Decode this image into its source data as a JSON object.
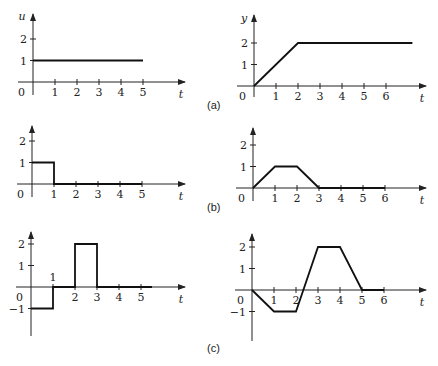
{
  "figure": {
    "panel_labels": [
      "(a)",
      "(b)",
      "(c)"
    ]
  },
  "chart_data": [
    {
      "id": "a-input",
      "panel": "(a)",
      "type": "line",
      "title": "",
      "xlabel": "t",
      "ylabel": "u",
      "x_ticks": [
        "1",
        "2",
        "3",
        "4",
        "5"
      ],
      "y_ticks": [
        "1",
        "2"
      ],
      "origin_label": "0",
      "xlim": [
        0,
        6.5
      ],
      "ylim": [
        0,
        2.5
      ],
      "grid": false,
      "points": [
        [
          0,
          1
        ],
        [
          5,
          1
        ]
      ]
    },
    {
      "id": "a-output",
      "panel": "(a)",
      "type": "line",
      "title": "",
      "xlabel": "t",
      "ylabel": "y",
      "x_ticks": [
        "1",
        "2",
        "3",
        "4",
        "5",
        "6"
      ],
      "y_ticks": [
        "1",
        "2"
      ],
      "origin_label": "0",
      "xlim": [
        0,
        7.8
      ],
      "ylim": [
        0,
        2.5
      ],
      "grid": false,
      "points": [
        [
          0,
          0
        ],
        [
          2,
          2
        ],
        [
          7.2,
          2
        ]
      ]
    },
    {
      "id": "b-input",
      "panel": "(b)",
      "type": "line",
      "title": "",
      "xlabel": "t",
      "ylabel": "",
      "x_ticks": [
        "1",
        "2",
        "3",
        "4",
        "5"
      ],
      "y_ticks": [
        "1",
        "2"
      ],
      "origin_label": "0",
      "xlim": [
        0,
        6.5
      ],
      "ylim": [
        0,
        2.5
      ],
      "grid": false,
      "points": [
        [
          0,
          1
        ],
        [
          1,
          1
        ],
        [
          1,
          0
        ],
        [
          5,
          0
        ]
      ]
    },
    {
      "id": "b-output",
      "panel": "(b)",
      "type": "line",
      "title": "",
      "xlabel": "t",
      "ylabel": "",
      "x_ticks": [
        "1",
        "2",
        "3",
        "4",
        "5",
        "6"
      ],
      "y_ticks": [
        "1",
        "2"
      ],
      "origin_label": "0",
      "xlim": [
        0,
        7.8
      ],
      "ylim": [
        0,
        2.5
      ],
      "grid": false,
      "points": [
        [
          0,
          0
        ],
        [
          1,
          1
        ],
        [
          2,
          1
        ],
        [
          3,
          0
        ],
        [
          6,
          0
        ]
      ]
    },
    {
      "id": "c-input",
      "panel": "(c)",
      "type": "line",
      "title": "",
      "xlabel": "t",
      "ylabel": "",
      "x_ticks": [
        "1",
        "2",
        "3",
        "4",
        "5"
      ],
      "y_ticks": [
        "-1",
        "1",
        "2"
      ],
      "origin_label": "0",
      "xlim": [
        0,
        6.5
      ],
      "ylim": [
        -2.3,
        2.5
      ],
      "grid": false,
      "points": [
        [
          0,
          -1
        ],
        [
          1,
          -1
        ],
        [
          1,
          0
        ],
        [
          2,
          0
        ],
        [
          2,
          2
        ],
        [
          3,
          2
        ],
        [
          3,
          0
        ],
        [
          5.5,
          0
        ]
      ]
    },
    {
      "id": "c-output",
      "panel": "(c)",
      "type": "line",
      "title": "",
      "xlabel": "t",
      "ylabel": "",
      "x_ticks": [
        "1",
        "2",
        "3",
        "4",
        "5",
        "6"
      ],
      "y_ticks": [
        "-1",
        "1",
        "2"
      ],
      "origin_label": "0",
      "xlim": [
        0,
        7.8
      ],
      "ylim": [
        -2.3,
        2.5
      ],
      "grid": false,
      "points": [
        [
          0,
          0
        ],
        [
          1,
          -1
        ],
        [
          2,
          -1
        ],
        [
          3,
          2
        ],
        [
          4,
          2
        ],
        [
          5,
          0
        ],
        [
          6,
          0
        ]
      ]
    }
  ]
}
